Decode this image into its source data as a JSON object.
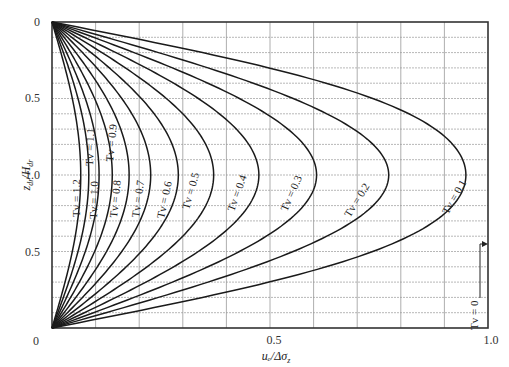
{
  "chart_data": {
    "type": "line",
    "title": "",
    "xlabel": "u_e/Δσ_z",
    "ylabel": "z_dr/H_dr",
    "xlim": [
      0,
      1.0
    ],
    "ylim": [
      0,
      2.0
    ],
    "x_ticks": [
      "0",
      "0.5",
      "1.0"
    ],
    "y_ticks_left": [
      "0",
      "0.5",
      "1.0",
      "0.5",
      "0"
    ],
    "grid": {
      "x_step": 0.1,
      "y_step": 0.1,
      "style": "dotted"
    },
    "series": [
      {
        "name": "Tv = 0.1",
        "Tv": 0.1,
        "peak_value": 0.95
      },
      {
        "name": "Tv = 0.2",
        "Tv": 0.2,
        "peak_value": 0.77
      },
      {
        "name": "Tv = 0.3",
        "Tv": 0.3,
        "peak_value": 0.61
      },
      {
        "name": "Tv = 0.4",
        "Tv": 0.4,
        "peak_value": 0.49
      },
      {
        "name": "Tv = 0.5",
        "Tv": 0.5,
        "peak_value": 0.39
      },
      {
        "name": "Tv = 0.6",
        "Tv": 0.6,
        "peak_value": 0.31
      },
      {
        "name": "Tv = 0.7",
        "Tv": 0.7,
        "peak_value": 0.24
      },
      {
        "name": "Tv = 0.8",
        "Tv": 0.8,
        "peak_value": 0.19
      },
      {
        "name": "Tv = 0.9",
        "Tv": 0.9,
        "peak_value": 0.15
      },
      {
        "name": "Tv = 1.0",
        "Tv": 1.0,
        "peak_value": 0.12
      },
      {
        "name": "Tv = 1.1",
        "Tv": 1.1,
        "peak_value": 0.1
      },
      {
        "name": "Tv = 1.2",
        "Tv": 1.2,
        "peak_value": 0.08
      }
    ],
    "annotations": [
      {
        "text": "Tv = 0",
        "note": "vertical line at u_e/Δσ_z = 1.0 with arrow"
      }
    ]
  },
  "labels": {
    "t01": "Tv = 0.1",
    "t02": "Tv = 0.2",
    "t03": "Tv = 0.3",
    "t04": "Tv = 0.4",
    "t05": "Tv = 0.5",
    "t06": "Tv = 0.6",
    "t07": "Tv = 0.7",
    "t08": "Tv = 0.8",
    "t09": "Tv = 0.9",
    "t10": "Tv = 1.0",
    "t11": "Tv = 1.1",
    "t12": "Tv = 1.2",
    "t0": "Tv = 0"
  },
  "axes": {
    "x0": "0",
    "x05": "0.5",
    "x10": "1.0",
    "y_top0": "0",
    "y_top05": "0.5",
    "y_mid10": "1.0",
    "y_bot05": "0.5",
    "y_bot0": "0",
    "xlabel": "uₑ/Δσ",
    "xlabel_sub": "z",
    "ylabel": "z",
    "ylabel_sub1": "dr",
    "ylabel_mid": "/H",
    "ylabel_sub2": "dr"
  }
}
